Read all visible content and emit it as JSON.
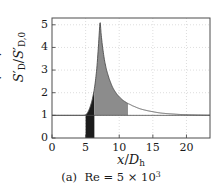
{
  "chart_data": {
    "type": "area",
    "title": "",
    "caption": "(a)  Re = 5 × 10³",
    "caption_label": "(a)",
    "caption_symbol": "Re",
    "caption_equals": "=",
    "caption_mantissa": "5",
    "caption_times": "×",
    "caption_base": "10",
    "caption_exponent": "3",
    "xlabel_num": "x",
    "xlabel_slash": "/",
    "xlabel_den": "D",
    "xlabel_den_sub": "h",
    "ylabel_num": "S",
    "ylabel_num_prime": "′",
    "ylabel_num_sub": "D",
    "ylabel_slash": "/",
    "ylabel_den": "S",
    "ylabel_den_prime": "′",
    "ylabel_den_sub": "D,0",
    "xlim": [
      0,
      23.5
    ],
    "ylim": [
      0,
      5.3
    ],
    "xticks": [
      0,
      5,
      10,
      15,
      20
    ],
    "yticks": [
      0,
      1,
      2,
      3,
      4,
      5
    ],
    "xtick_labels": [
      "0",
      "5",
      "10",
      "15",
      "20"
    ],
    "ytick_labels": [
      "0",
      "1",
      "2",
      "3",
      "4",
      "5"
    ],
    "grid": true,
    "grid_style": "dotted",
    "grid_color": "#cfcfcf",
    "legend": null,
    "baseline": 1,
    "peak_x": 7.15,
    "peak_y": 5.1,
    "onset_x": 5.0,
    "dark_fill_x_start": 5.0,
    "dark_fill_x_end": 6.3,
    "gray_fill_x_start": 6.3,
    "gray_fill_x_end": 11.3,
    "dark_fill_color": "#1c1c1c",
    "gray_fill_color": "#8c8c8c",
    "curve_color": "#4d4d4d",
    "axis_color": "#4d4d4d",
    "series": [
      {
        "name": "S'_D / S'_D,0",
        "x": [
          0.0,
          1.0,
          2.0,
          3.0,
          4.0,
          4.6,
          5.0,
          5.2,
          5.4,
          5.6,
          5.8,
          6.0,
          6.2,
          6.3,
          6.5,
          6.7,
          6.9,
          7.0,
          7.15,
          7.3,
          7.5,
          7.8,
          8.1,
          8.5,
          9.0,
          9.5,
          10.0,
          10.5,
          11.0,
          11.3,
          12.0,
          13.0,
          14.0,
          15.0,
          16.0,
          17.0,
          18.0,
          19.0,
          20.0,
          21.5,
          23.5
        ],
        "y": [
          1.0,
          1.0,
          1.0,
          1.0,
          1.0,
          1.0,
          1.02,
          1.08,
          1.18,
          1.32,
          1.5,
          1.72,
          2.0,
          2.18,
          2.62,
          3.2,
          4.0,
          4.5,
          5.1,
          4.6,
          4.05,
          3.45,
          3.02,
          2.62,
          2.25,
          2.0,
          1.82,
          1.68,
          1.58,
          1.52,
          1.42,
          1.3,
          1.22,
          1.16,
          1.11,
          1.08,
          1.06,
          1.04,
          1.03,
          1.02,
          1.01
        ]
      }
    ]
  }
}
